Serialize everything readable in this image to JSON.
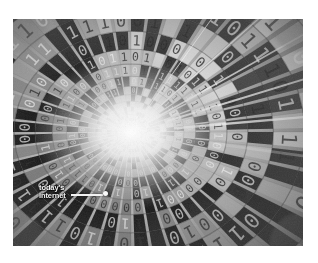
{
  "figure": {
    "name": "binary-data-tunnel",
    "medium": "grayscale-photo-illustration",
    "canvas": {
      "width": 318,
      "height": 263,
      "background": "#ffffff"
    },
    "plate": {
      "x": 13,
      "y": 19,
      "width": 290,
      "height": 227
    }
  },
  "annotation": {
    "label_line_1": "today's",
    "label_line_2": "internet",
    "arrow": {
      "name": "pointer-arrow",
      "style": "line-with-dot-head",
      "color": "#f2f2f2",
      "from_x": 58,
      "from_y": 175,
      "to_x": 93,
      "to_y": 175
    },
    "text_color": "#f4f4f4"
  },
  "tunnel": {
    "vanishing_point_x": 118,
    "vanishing_point_y": 113,
    "ring_count": 26,
    "spoke_count": 48,
    "glyphs": [
      "0",
      "1"
    ],
    "highlight_color": "#fdfdfd",
    "mid_tone": "#9a9a9a",
    "shadow_tone": "#3a3a3a",
    "core_glow": "#f2f2f2"
  },
  "palette": {
    "page_background": "#ffffff",
    "plate_base": "#8d8d8d",
    "light": "#e8e8e8",
    "dark": "#2e2e2e"
  }
}
